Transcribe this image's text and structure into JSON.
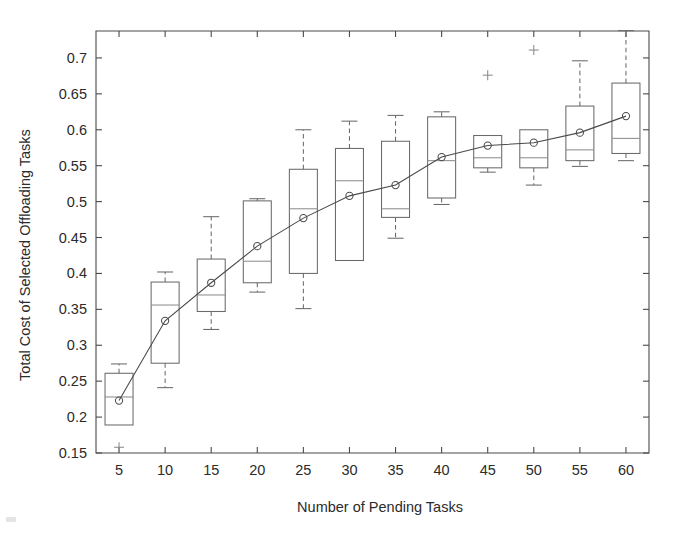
{
  "chart_data": {
    "type": "box",
    "title": "",
    "xlabel": "Number of Pending Tasks",
    "ylabel": "Total Cost of Selected Offloading Tasks",
    "xlim": [
      2.5,
      62.5
    ],
    "ylim": [
      0.15,
      0.7375
    ],
    "grid": false,
    "legend": "none",
    "x_ticks": [
      "5",
      "10",
      "15",
      "20",
      "25",
      "30",
      "35",
      "40",
      "45",
      "50",
      "55",
      "60"
    ],
    "y_ticks": [
      "0.15",
      "0.2",
      "0.25",
      "0.3",
      "0.35",
      "0.4",
      "0.45",
      "0.5",
      "0.55",
      "0.6",
      "0.65",
      "0.7"
    ],
    "categories": [
      5,
      10,
      15,
      20,
      25,
      30,
      35,
      40,
      45,
      50,
      55,
      60
    ],
    "boxes": [
      {
        "x": 5,
        "whisker_low": 0.189,
        "q1": 0.189,
        "median": 0.228,
        "q3": 0.261,
        "whisker_high": 0.274,
        "mean": 0.223,
        "outliers": [
          0.158
        ]
      },
      {
        "x": 10,
        "whisker_low": 0.241,
        "q1": 0.275,
        "median": 0.356,
        "q3": 0.388,
        "whisker_high": 0.402,
        "mean": 0.334,
        "outliers": []
      },
      {
        "x": 15,
        "whisker_low": 0.322,
        "q1": 0.347,
        "median": 0.37,
        "q3": 0.42,
        "whisker_high": 0.479,
        "mean": 0.387,
        "outliers": []
      },
      {
        "x": 20,
        "whisker_low": 0.374,
        "q1": 0.387,
        "median": 0.417,
        "q3": 0.501,
        "whisker_high": 0.504,
        "mean": 0.438,
        "outliers": []
      },
      {
        "x": 25,
        "whisker_low": 0.351,
        "q1": 0.4,
        "median": 0.49,
        "q3": 0.545,
        "whisker_high": 0.6,
        "mean": 0.477,
        "outliers": []
      },
      {
        "x": 30,
        "whisker_low": 0.418,
        "q1": 0.418,
        "median": 0.529,
        "q3": 0.574,
        "whisker_high": 0.612,
        "mean": 0.508,
        "outliers": []
      },
      {
        "x": 35,
        "whisker_low": 0.449,
        "q1": 0.478,
        "median": 0.49,
        "q3": 0.584,
        "whisker_high": 0.62,
        "mean": 0.523,
        "outliers": []
      },
      {
        "x": 40,
        "whisker_low": 0.496,
        "q1": 0.505,
        "median": 0.557,
        "q3": 0.618,
        "whisker_high": 0.625,
        "mean": 0.562,
        "outliers": []
      },
      {
        "x": 45,
        "whisker_low": 0.541,
        "q1": 0.547,
        "median": 0.561,
        "q3": 0.592,
        "whisker_high": 0.592,
        "mean": 0.578,
        "outliers": [
          0.676
        ]
      },
      {
        "x": 50,
        "whisker_low": 0.523,
        "q1": 0.547,
        "median": 0.561,
        "q3": 0.6,
        "whisker_high": 0.6,
        "mean": 0.582,
        "outliers": [
          0.711
        ]
      },
      {
        "x": 55,
        "whisker_low": 0.549,
        "q1": 0.557,
        "median": 0.572,
        "q3": 0.633,
        "whisker_high": 0.696,
        "mean": 0.596,
        "outliers": []
      },
      {
        "x": 60,
        "whisker_low": 0.557,
        "q1": 0.567,
        "median": 0.588,
        "q3": 0.665,
        "whisker_high": 0.738,
        "mean": 0.619,
        "outliers": []
      }
    ],
    "mean_series": {
      "name": "mean",
      "x": [
        5,
        10,
        15,
        20,
        25,
        30,
        35,
        40,
        45,
        50,
        55,
        60
      ],
      "values": [
        0.223,
        0.334,
        0.387,
        0.438,
        0.477,
        0.508,
        0.523,
        0.562,
        0.578,
        0.582,
        0.596,
        0.619
      ]
    },
    "colors": {
      "box": "#6a6a6a",
      "median": "#8d8d8d",
      "mean_line": "#4a4a4a",
      "outlier": "#8a8a8a",
      "axis": "#4a4a4a",
      "background": "#ffffff"
    }
  }
}
